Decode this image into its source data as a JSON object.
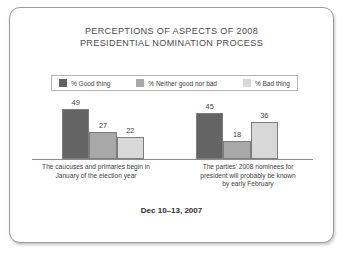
{
  "slide": {
    "title_lines": [
      "PERCEPTIONS OF ASPECTS OF 2008",
      "PRESIDENTIAL NOMINATION PROCESS"
    ],
    "footer": "Dec 10–13, 2007"
  },
  "colors": {
    "good_thing": "#646464",
    "neither": "#a8a8a8",
    "bad_thing": "#d8d8d8",
    "bar_outline": "#7d7d7d",
    "frame_border": "#9b9b9b",
    "text": "#3d3d3d",
    "title": "#4a4a4a",
    "baseline": "#8c8c8c"
  },
  "chart_data": {
    "type": "bar",
    "title": "PERCEPTIONS OF ASPECTS OF 2008 PRESIDENTIAL NOMINATION PROCESS",
    "subtitle": "",
    "xlabel": "",
    "ylabel": "",
    "ylim": [
      0,
      60
    ],
    "grid": false,
    "legend_position": "top",
    "value_labels": true,
    "categories": [
      "The caucuses and primaries begin in January of the election year",
      "The parties' 2008 nominees for president will probably be known by early February"
    ],
    "category_lines": [
      [
        "The caucuses and primaries begin in",
        "January of the election year"
      ],
      [
        "The parties' 2008 nominees for",
        "president will probably be known",
        "by early February"
      ]
    ],
    "series": [
      {
        "name": "% Good thing",
        "color": "#646464",
        "values": [
          49,
          45
        ]
      },
      {
        "name": "% Neither good nor bad",
        "color": "#a8a8a8",
        "values": [
          27,
          18
        ]
      },
      {
        "name": "% Bad thing",
        "color": "#d8d8d8",
        "values": [
          22,
          36
        ]
      }
    ],
    "annotations": [
      "Dec 10–13, 2007"
    ]
  }
}
